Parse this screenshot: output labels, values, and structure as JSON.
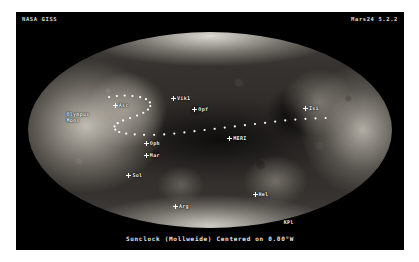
{
  "window": {
    "app_name": "Mars24",
    "background_color": "#ffffff",
    "panel_color": "#000000"
  },
  "header": {
    "left_label": "NASA GISS",
    "right_label": "Mars24 5.2.2",
    "text_color": "#d8d8d8"
  },
  "map": {
    "projection_name": "Mollweide",
    "clock_mode": "Sunclock",
    "center_longitude": "0.00",
    "center_hemisphere": "W",
    "caption": "Sunclock (Mollweide) Centered on 0.00°W",
    "accent_color": "#ffffff",
    "surface_base_color": "#3b3835",
    "bright_terrain_color": "#cdc8be",
    "dark_albedo_color": "#0e0e0e"
  },
  "markers": [
    {
      "id": "olympus-mons",
      "label_line1": "Olympus",
      "label_line2": "Mons",
      "x": 13.0,
      "y": 41.0,
      "two_line": true,
      "cross": false
    },
    {
      "id": "ascraeus",
      "label_line1": "Asc",
      "label_line2": "",
      "x": 26.5,
      "y": 36.5,
      "two_line": false,
      "cross": true
    },
    {
      "id": "viking-1",
      "label_line1": "Vik1",
      "label_line2": "",
      "x": 41.5,
      "y": 33.0,
      "two_line": false,
      "cross": true
    },
    {
      "id": "opportunity",
      "label_line1": "Opf",
      "label_line2": "",
      "x": 47.0,
      "y": 38.5,
      "two_line": false,
      "cross": true
    },
    {
      "id": "ophir",
      "label_line1": "Oph",
      "label_line2": "",
      "x": 34.5,
      "y": 55.5,
      "two_line": false,
      "cross": true
    },
    {
      "id": "mariner",
      "label_line1": "Mar",
      "label_line2": "",
      "x": 34.5,
      "y": 61.5,
      "two_line": false,
      "cross": true
    },
    {
      "id": "solis",
      "label_line1": "Sol",
      "label_line2": "",
      "x": 30.0,
      "y": 71.5,
      "two_line": false,
      "cross": true
    },
    {
      "id": "argyre",
      "label_line1": "Arg",
      "label_line2": "",
      "x": 42.0,
      "y": 87.0,
      "two_line": false,
      "cross": true
    },
    {
      "id": "meridiani",
      "label_line1": "MERI",
      "label_line2": "",
      "x": 56.0,
      "y": 53.0,
      "two_line": false,
      "cross": true
    },
    {
      "id": "isidis",
      "label_line1": "Isi",
      "label_line2": "",
      "x": 75.5,
      "y": 38.0,
      "two_line": false,
      "cross": true
    },
    {
      "id": "hellas",
      "label_line1": "Hel",
      "label_line2": "",
      "x": 62.5,
      "y": 81.0,
      "two_line": false,
      "cross": true
    },
    {
      "id": "kpl",
      "label_line1": "KPl",
      "label_line2": "",
      "x": 69.0,
      "y": 95.0,
      "two_line": false,
      "cross": false
    }
  ],
  "sun_path": {
    "description": "dotted subsolar track",
    "dot_color": "#ffffff",
    "points": [
      [
        24.0,
        33.5
      ],
      [
        26.0,
        33.0
      ],
      [
        28.0,
        32.8
      ],
      [
        30.0,
        33.0
      ],
      [
        32.0,
        33.6
      ],
      [
        33.5,
        34.6
      ],
      [
        34.5,
        36.2
      ],
      [
        34.6,
        38.0
      ],
      [
        34.0,
        39.8
      ],
      [
        32.8,
        41.4
      ],
      [
        31.2,
        42.8
      ],
      [
        29.4,
        44.0
      ],
      [
        27.6,
        45.2
      ],
      [
        26.2,
        46.6
      ],
      [
        25.4,
        48.2
      ],
      [
        25.6,
        49.8
      ],
      [
        26.6,
        51.0
      ],
      [
        28.4,
        51.8
      ],
      [
        30.6,
        52.2
      ],
      [
        33.0,
        52.4
      ],
      [
        35.6,
        52.4
      ],
      [
        38.2,
        52.2
      ],
      [
        40.8,
        51.8
      ],
      [
        43.4,
        51.2
      ],
      [
        46.0,
        50.6
      ],
      [
        48.6,
        50.0
      ],
      [
        51.2,
        49.4
      ],
      [
        53.8,
        48.8
      ],
      [
        56.4,
        48.2
      ],
      [
        59.0,
        47.6
      ],
      [
        61.6,
        47.0
      ],
      [
        64.2,
        46.4
      ],
      [
        66.8,
        45.8
      ],
      [
        69.4,
        45.2
      ],
      [
        72.0,
        44.8
      ],
      [
        74.6,
        44.4
      ],
      [
        77.2,
        44.2
      ],
      [
        79.8,
        44.0
      ]
    ]
  },
  "footer": {
    "caption": "Sunclock (Mollweide) Centered on 0.00°W",
    "text_color": "#e6e4e0"
  }
}
